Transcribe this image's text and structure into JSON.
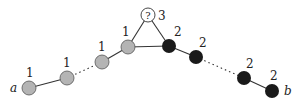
{
  "diagram": {
    "colors": {
      "gray": "#b4b4b4",
      "black": "#1a1a1a",
      "white": "#ffffff",
      "edge": "#333333"
    },
    "endpoint_a": "a",
    "endpoint_b": "b",
    "question_node": {
      "symbol": "?",
      "label": "3"
    },
    "gray_nodes": [
      {
        "label": "1"
      },
      {
        "label": "1"
      },
      {
        "label": "1"
      },
      {
        "label": "1"
      }
    ],
    "black_nodes": [
      {
        "label": "2"
      },
      {
        "label": "2"
      },
      {
        "label": "2"
      },
      {
        "label": "2"
      }
    ]
  }
}
